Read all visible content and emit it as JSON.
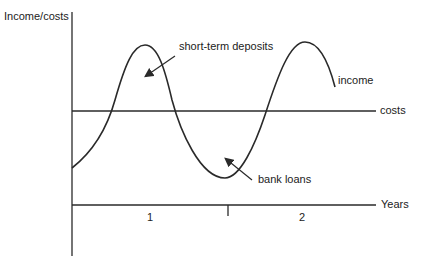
{
  "diagram": {
    "y_axis_label": "Income/costs",
    "x_axis_label": "Years",
    "x_ticks": [
      "1",
      "2"
    ],
    "series": {
      "income_label": "income",
      "costs_label": "costs"
    },
    "annotations": {
      "surplus": "short-term deposits",
      "deficit": "bank loans"
    },
    "colors": {
      "line": "#2a2a2a",
      "background": "#ffffff"
    }
  }
}
